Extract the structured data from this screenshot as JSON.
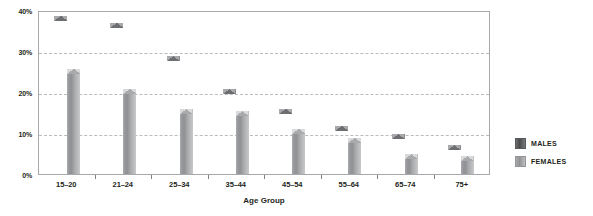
{
  "chart_data": {
    "type": "bar",
    "title": "",
    "xlabel": "Age Group",
    "ylabel": "",
    "ylim": [
      0,
      40
    ],
    "grid": true,
    "legend_position": "right",
    "y_ticks": [
      "0%",
      "10%",
      "20%",
      "30%",
      "40%"
    ],
    "y_tick_values": [
      0,
      10,
      20,
      30,
      40
    ],
    "categories": [
      "15–20",
      "21–24",
      "25–34",
      "35–44",
      "45–54",
      "55–64",
      "65–74",
      "75+"
    ],
    "series": [
      {
        "name": "MALES",
        "color": "#58595b",
        "values": [
          38.5,
          36.8,
          28.8,
          20.8,
          15.8,
          11.8,
          9.8,
          7.0
        ]
      },
      {
        "name": "FEMALES",
        "color": "#a8aaac",
        "values": [
          25.5,
          20.8,
          15.8,
          15.3,
          11.0,
          8.8,
          5.0,
          4.3
        ]
      }
    ]
  },
  "legend": {
    "items": [
      {
        "label": "MALES"
      },
      {
        "label": "FEMALES"
      }
    ]
  }
}
